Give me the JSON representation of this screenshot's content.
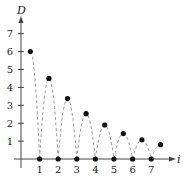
{
  "chart_data": {
    "type": "scatter",
    "title": "",
    "xlabel": "i",
    "ylabel": "D",
    "xlim": [
      0,
      8
    ],
    "ylim": [
      0,
      7.5
    ],
    "x_ticks": [
      "1",
      "2",
      "3",
      "4",
      "5",
      "6",
      "7"
    ],
    "y_ticks": [
      "1",
      "2",
      "3",
      "4",
      "5",
      "6",
      "7"
    ],
    "grid": false,
    "series": [
      {
        "name": "peak heights",
        "x": [
          0.5,
          1.5,
          2.5,
          3.5,
          4.5,
          5.5,
          6.5,
          7.5
        ],
        "y": [
          6,
          4.5,
          3.375,
          2.53,
          1.9,
          1.42,
          1.07,
          0.8
        ]
      },
      {
        "name": "ground contacts",
        "x": [
          1,
          2,
          3,
          4,
          5,
          6,
          7
        ],
        "y": [
          0,
          0,
          0,
          0,
          0,
          0,
          0
        ]
      }
    ],
    "bounce_path": "dashed arcs between ground contacts through each peak"
  }
}
